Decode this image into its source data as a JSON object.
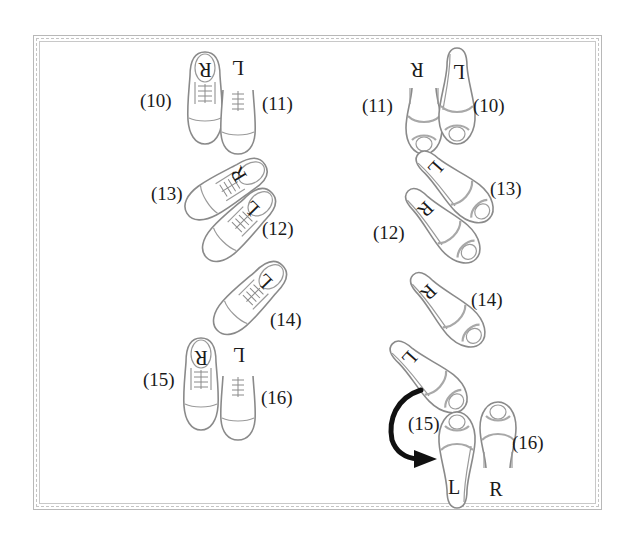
{
  "diagram": {
    "type": "dance-footwork-diagram",
    "frame": {
      "border_color": "#b8b8b8",
      "style": "double-dashed"
    },
    "colors": {
      "shoe_outline": "#8a8a8a",
      "text": "#1a1a1a",
      "arrow": "#111111"
    },
    "mens_column": {
      "shoe_style": "dress-shoe",
      "steps": [
        {
          "step": "(10)",
          "foot": "R",
          "orientation": "toe-down"
        },
        {
          "step": "(11)",
          "foot": "L",
          "orientation": "toe-down"
        },
        {
          "step": "(13)",
          "foot": "R",
          "orientation": "diagonal"
        },
        {
          "step": "(12)",
          "foot": "L",
          "orientation": "diagonal"
        },
        {
          "step": "(14)",
          "foot": "L",
          "orientation": "diagonal"
        },
        {
          "step": "(15)",
          "foot": "R",
          "orientation": "toe-down"
        },
        {
          "step": "(16)",
          "foot": "L",
          "orientation": "toe-down"
        }
      ]
    },
    "womens_column": {
      "shoe_style": "high-heel",
      "steps": [
        {
          "step": "(11)",
          "foot": "R",
          "orientation": "toe-down"
        },
        {
          "step": "(10)",
          "foot": "L",
          "orientation": "toe-down"
        },
        {
          "step": "(13)",
          "foot": "L",
          "orientation": "diagonal"
        },
        {
          "step": "(12)",
          "foot": "R",
          "orientation": "diagonal"
        },
        {
          "step": "(14)",
          "foot": "R",
          "orientation": "diagonal"
        },
        {
          "step": "(15)",
          "foot": "L",
          "orientation": "toe-up",
          "note": "pivot-turn"
        },
        {
          "step": "(16)",
          "foot": "R",
          "orientation": "toe-up"
        }
      ],
      "turning_foot_letter": "L",
      "arrow": {
        "direction": "curved-clockwise",
        "label_step": "(15)"
      }
    }
  }
}
